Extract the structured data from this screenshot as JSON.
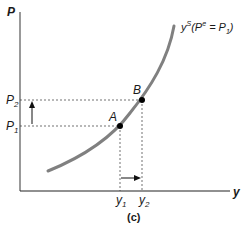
{
  "diagram": {
    "panel_label": "(c)",
    "axes": {
      "y_axis_label": "P",
      "x_axis_label": "y"
    },
    "curve": {
      "label_main": "y",
      "label_sup": "S",
      "label_paren_open": "(P",
      "label_paren_sup": "e",
      "label_eq": " = P",
      "label_sub": "1",
      "label_close": ")",
      "color": "#808080"
    },
    "points": [
      {
        "name": "A",
        "label": "A"
      },
      {
        "name": "B",
        "label": "B"
      }
    ],
    "price_levels": [
      {
        "label": "P",
        "sub": "1"
      },
      {
        "label": "P",
        "sub": "2"
      }
    ],
    "output_levels": [
      {
        "label": "y",
        "sub": "1"
      },
      {
        "label": "y",
        "sub": "2"
      }
    ],
    "arrows": {
      "price_change": "up",
      "output_change": "right"
    }
  }
}
